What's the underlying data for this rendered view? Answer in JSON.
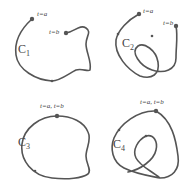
{
  "panels": [
    {
      "name": "C",
      "subscript": "1",
      "labels": [
        "t=a",
        "t=b"
      ],
      "description": "simple non-closed curve"
    },
    {
      "name": "C",
      "subscript": "2",
      "labels": [
        "t=a",
        "t=b"
      ],
      "description": "non-simple non-closed curve"
    },
    {
      "name": "C",
      "subscript": "3",
      "labels": [
        "t=a, t=b"
      ],
      "description": "simple closed curve"
    },
    {
      "name": "C",
      "subscript": "4",
      "labels": [
        "t=a, t=b"
      ],
      "description": "non-simple closed curve"
    }
  ],
  "colors": {
    "curve": "#555555",
    "text": "#444444",
    "background": "#ffffff"
  }
}
